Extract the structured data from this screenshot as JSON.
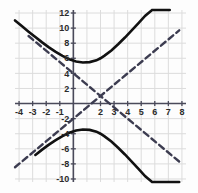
{
  "chart_data": {
    "type": "line",
    "title": "",
    "xlabel": "",
    "ylabel": "",
    "xlim": [
      -4.3,
      8.3
    ],
    "ylim": [
      -10.4,
      12.4
    ],
    "grid": true,
    "legend": "none",
    "x_ticks": [
      -4,
      -3,
      -2,
      -1,
      2,
      3,
      4,
      5,
      6,
      7,
      8
    ],
    "x_tick_labels": [
      "-4",
      "-3",
      "-2",
      "-1",
      "2",
      "3",
      "4",
      "5",
      "6",
      "7",
      "8"
    ],
    "y_ticks": [
      12,
      10,
      8,
      6,
      4,
      2,
      -2,
      -4,
      -6,
      -8,
      -10
    ],
    "y_tick_labels": [
      "12",
      "10",
      "8",
      "6",
      "4",
      "2",
      "-2",
      "-4",
      "-6",
      "-8",
      "-10"
    ],
    "x_gridlines": [
      -4,
      -3,
      -2,
      -1,
      0,
      1,
      2,
      3,
      4,
      5,
      6,
      7,
      8
    ],
    "y_gridlines": [
      12,
      10,
      8,
      6,
      4,
      2,
      0,
      -2,
      -4,
      -6,
      -8,
      -10
    ],
    "annotations": [
      "Vertical hyperbola centered at (2, 1)",
      "Upper branch vertex (2, 7)",
      "Lower branch vertex (2, -5)",
      "Asymptotes cross at (2, 1) with slopes +1.5 and -1.5"
    ],
    "series": [
      {
        "name": "hyperbola-upper-branch",
        "style": "solid",
        "color": "#111111",
        "width": 2.6,
        "x": [
          -4.3,
          -3.8,
          -3.3,
          -2.8,
          -2.3,
          -1.8,
          -1.3,
          -0.8,
          -0.3,
          0.2,
          0.7,
          1.2,
          1.7,
          2.0,
          2.3,
          2.8,
          3.3,
          3.8,
          4.3,
          4.8,
          5.3,
          5.8,
          6.3,
          6.8,
          7.1
        ],
        "y": [
          11.02,
          10.27,
          9.53,
          8.81,
          8.11,
          7.45,
          6.84,
          6.31,
          5.88,
          5.58,
          5.44,
          5.49,
          5.73,
          6.0,
          6.35,
          7.04,
          7.86,
          8.75,
          9.69,
          10.66,
          11.65,
          12.4,
          12.4,
          12.4,
          12.4
        ]
      },
      {
        "name": "hyperbola-lower-branch",
        "style": "solid",
        "color": "#111111",
        "width": 2.6,
        "x": [
          -2.8,
          -2.3,
          -1.8,
          -1.3,
          -0.8,
          -0.3,
          0.2,
          0.7,
          1.2,
          1.7,
          2.0,
          2.3,
          2.8,
          3.3,
          3.8,
          4.3,
          4.8,
          5.3,
          5.8,
          6.3,
          6.8,
          7.3,
          7.8
        ],
        "y": [
          -6.81,
          -6.11,
          -5.45,
          -4.84,
          -4.31,
          -3.88,
          -3.58,
          -3.44,
          -3.49,
          -3.73,
          -4.0,
          -4.35,
          -5.04,
          -5.86,
          -6.75,
          -7.69,
          -8.66,
          -9.65,
          -10.4,
          -10.4,
          -10.4,
          -10.4,
          -10.4
        ]
      },
      {
        "name": "asymptote-positive-slope",
        "style": "dashed",
        "color": "#3c3c50",
        "width": 2.4,
        "slope": 1.5,
        "x": [
          -4.3,
          7.8
        ],
        "y": [
          -8.45,
          9.7
        ]
      },
      {
        "name": "asymptote-negative-slope",
        "style": "dashed",
        "color": "#3c3c50",
        "width": 2.4,
        "slope": -1.5,
        "x": [
          -3.3,
          8.0
        ],
        "y": [
          8.95,
          -8.0
        ]
      }
    ],
    "colors": {
      "curve": "#111111",
      "asymptote": "#3c3c50",
      "grid": "#dcdcdc",
      "axis": "#4a4a5a",
      "background": "#fdfdfd",
      "tick_text": "#2b2b2b"
    }
  }
}
